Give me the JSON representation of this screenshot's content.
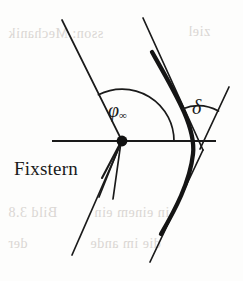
{
  "figure": {
    "background_color": "#fdfdfc",
    "ink_color": "#1a1a1a",
    "ghost_color": "#cfcac6",
    "width": 243,
    "height": 281,
    "labels": {
      "fixstern": "Fixstern",
      "phi_symbol": "φ",
      "phi_subscript": "∞",
      "delta_symbol": "δ"
    },
    "ghost_text": [
      {
        "text": "sson: Mechanik",
        "x": 8,
        "y": 26
      },
      {
        "text": "ziel",
        "x": 188,
        "y": 24
      },
      {
        "text": "Bild 3.8",
        "x": 8,
        "y": 205
      },
      {
        "text": "in  einem  ein",
        "x": 94,
        "y": 205
      },
      {
        "text": "der",
        "x": 8,
        "y": 236
      },
      {
        "text": "die  im  ande",
        "x": 90,
        "y": 236
      }
    ],
    "geometry": {
      "axis": {
        "x1": 52,
        "y1": 141,
        "x2": 216,
        "y2": 141,
        "stroke_width": 2.2
      },
      "fixstern_point": {
        "cx": 122,
        "cy": 141,
        "r": 5.2
      },
      "asymptote_upper_left": {
        "x1": 62,
        "y1": 20,
        "x2": 122,
        "y2": 141,
        "stroke_width": 1.7
      },
      "asymptote_lower_left": {
        "x1": 122,
        "y1": 141,
        "x2": 72,
        "y2": 255,
        "stroke_width": 1.7
      },
      "asymptote_upper_right": {
        "x1": 143,
        "y1": 18,
        "x2": 203,
        "y2": 150,
        "stroke_width": 1.7
      },
      "asymptote_lower_right": {
        "x1": 203,
        "y1": 150,
        "x2": 150,
        "y2": 262,
        "stroke_width": 1.7
      },
      "delta_ray": {
        "x1": 200,
        "y1": 147,
        "x2": 228,
        "y2": 88,
        "stroke_width": 1.7
      },
      "orbit_curve": {
        "start": [
          152,
          52
        ],
        "control": [
          200,
          148
        ],
        "end": [
          160,
          234
        ],
        "stroke_width": 4.2
      },
      "phi_arc": {
        "cx": 122,
        "cy": 141,
        "r": 52,
        "start_deg": 0,
        "end_deg": 117,
        "stroke_width": 1.7
      },
      "delta_arc": {
        "cx": 200,
        "cy": 147,
        "r": 42,
        "start_deg": 64,
        "end_deg": 115,
        "stroke_width": 1.7
      },
      "leader_line": {
        "x1": 104,
        "y1": 176,
        "x2": 122,
        "y2": 141,
        "stroke_width": 2.0
      },
      "extra_ray_a": {
        "x1": 122,
        "y1": 141,
        "x2": 100,
        "y2": 196,
        "stroke_width": 1.6
      },
      "extra_ray_b": {
        "x1": 122,
        "y1": 141,
        "x2": 112,
        "y2": 198,
        "stroke_width": 1.6
      }
    }
  }
}
